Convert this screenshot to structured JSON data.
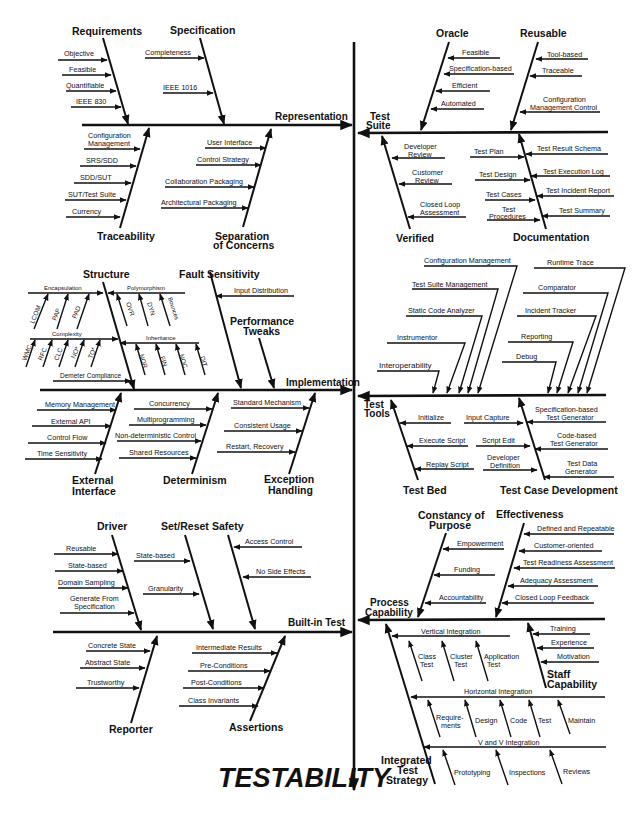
{
  "title": "TESTABILITY",
  "colors": {
    "ink": "#111111",
    "background": "#ffffff"
  },
  "main_axis": {
    "label": "TESTABILITY",
    "direction": "down"
  },
  "spines": [
    {
      "id": "representation",
      "label": "Representation",
      "side": "left",
      "y": 152,
      "arrow_into_axis": true,
      "branches": [
        {
          "label": "Requirements",
          "position": "top",
          "items": [
            "Objective",
            "Feasible",
            "Quantifiable",
            "IEEE 830"
          ]
        },
        {
          "label": "Specification",
          "position": "top",
          "items": [
            "Completeness",
            "IEEE 1016"
          ]
        },
        {
          "label": "Traceability",
          "position": "bottom",
          "items": [
            "Configuration Management",
            "SRS/SDD",
            "SDD/SUT",
            "SUT/Test Suite",
            "Currency"
          ]
        },
        {
          "label": "Separation of Concerns",
          "position": "bottom",
          "items": [
            "User Interface",
            "Control Strategy",
            "Collaboration Packaging",
            "Architectural Packaging"
          ]
        }
      ]
    },
    {
      "id": "test-suite",
      "label": "Test Suite",
      "side": "right",
      "y": 132,
      "branches": [
        {
          "label": "Oracle",
          "position": "top",
          "items": [
            "Feasible",
            "Specification-based",
            "Efficient",
            "Automated"
          ]
        },
        {
          "label": "Reusable",
          "position": "top",
          "items": [
            "Tool-based",
            "Traceable",
            "Configuration Management Control"
          ]
        },
        {
          "label": "Verified",
          "position": "bottom",
          "items": [
            "Developer Review",
            "Customer Review",
            "Closed Loop Assessment"
          ]
        },
        {
          "label": "Documentation",
          "position": "bottom",
          "items_left": [
            "Test Plan",
            "Test Design",
            "Test Cases",
            "Test Procedures"
          ],
          "items_right": [
            "Test Result Schema",
            "Test Execution Log",
            "Test Incident Report",
            "Test Summary"
          ]
        }
      ]
    },
    {
      "id": "implementation",
      "label": "Implementation",
      "side": "left",
      "y": 390,
      "branches": [
        {
          "label": "Structure",
          "position": "top",
          "sub_branches": [
            {
              "label": "Encapsulation",
              "items": [
                "LCOM",
                "PAP",
                "PAD"
              ]
            },
            {
              "label": "Polymorphism",
              "items": [
                "OVR",
                "DYN",
                "Bounces"
              ]
            },
            {
              "label": "Complexity",
              "items": [
                "WMC",
                "RFC",
                "CLC",
                "NO*",
                "TO*"
              ]
            },
            {
              "label": "Inheritance",
              "items": [
                "NOR",
                "FIN",
                "NOC",
                "DIT"
              ]
            }
          ],
          "items": [
            "Demeter Compliance"
          ]
        },
        {
          "label": "Fault Sensitivity",
          "position": "top",
          "items": [
            "Input Distribution"
          ]
        },
        {
          "label": "Performance Tweaks",
          "position": "top",
          "items": []
        },
        {
          "label": "External Interface",
          "position": "bottom",
          "items": [
            "Memory Management",
            "External API",
            "Control Flow",
            "Time Sensitivity"
          ]
        },
        {
          "label": "Determinism",
          "position": "bottom",
          "items": [
            "Concurrency",
            "Multiprogramming",
            "Non-deterministic Control",
            "Shared Resources"
          ]
        },
        {
          "label": "Exception Handling",
          "position": "bottom",
          "items": [
            "Standard Mechanism",
            "Consistent Usage",
            "Restart, Recovery"
          ]
        }
      ]
    },
    {
      "id": "test-tools",
      "label": "Test Tools",
      "side": "right",
      "y": 395,
      "top_items_group1": [
        "Configuration Management",
        "Test Suite Management",
        "Static Code Analyzer",
        "Instrumentor",
        "Interoperability"
      ],
      "top_items_group2": [
        "Runtime Trace",
        "Comparator",
        "Incident Tracker",
        "Reporting",
        "Debug"
      ],
      "branches": [
        {
          "label": "Test Bed",
          "position": "bottom",
          "items": [
            "Initialize",
            "Execute Script",
            "Replay Script"
          ]
        },
        {
          "label": "Test Case Development",
          "position": "bottom",
          "items_left": [
            "Input Capture",
            "Script Edit",
            "Developer Definition"
          ],
          "items_right": [
            "Specification-based Test Generator",
            "Code-based Test Generator",
            "Test Data Generator"
          ]
        }
      ]
    },
    {
      "id": "built-in-test",
      "label": "Built-in Test",
      "side": "left",
      "y": 631,
      "branches": [
        {
          "label": "Driver",
          "position": "top",
          "items": [
            "Reusable",
            "State-based",
            "Domain Sampling",
            "Generate From Specification"
          ]
        },
        {
          "label": "Set/Reset",
          "position": "top",
          "items": [
            "State-based",
            "Granularity"
          ]
        },
        {
          "label": "Safety",
          "position": "top",
          "items": [
            "Access Control",
            "No Side Effects"
          ]
        },
        {
          "label": "Reporter",
          "position": "bottom",
          "items": [
            "Concrete State",
            "Abstract State",
            "Trustworthy"
          ]
        },
        {
          "label": "Assertions",
          "position": "bottom",
          "items": [
            "Intermediate Results",
            "Pre-Conditions",
            "Post-Conditions",
            "Class Invariants"
          ]
        }
      ]
    },
    {
      "id": "process-capability",
      "label": "Process Capability",
      "side": "right",
      "y": 619,
      "branches": [
        {
          "label": "Constancy of Purpose",
          "position": "top",
          "items": [
            "Empowerment",
            "Funding",
            "Accountability"
          ]
        },
        {
          "label": "Effectiveness",
          "position": "top",
          "items": [
            "Defined and Repeatable",
            "Customer-oriented",
            "Test Readiness Assessment",
            "Adequacy Assessment",
            "Closed Loop Feedback"
          ]
        },
        {
          "label": "Staff Capability",
          "position": "bottom",
          "items": [
            "Training",
            "Experience",
            "Motivation"
          ]
        },
        {
          "label": "Integrated Test Strategy",
          "position": "bottom",
          "sub_branches": [
            {
              "label": "Vertical Integration",
              "items": [
                "Class Test",
                "Cluster Test",
                "Application Test"
              ]
            },
            {
              "label": "Horizontal Integration",
              "items": [
                "Require-ments",
                "Design",
                "Code",
                "Test",
                "Maintain"
              ]
            },
            {
              "label": "V and V Integration",
              "items": [
                "Prototyping",
                "Inspections",
                "Reviews"
              ]
            }
          ]
        }
      ]
    }
  ]
}
